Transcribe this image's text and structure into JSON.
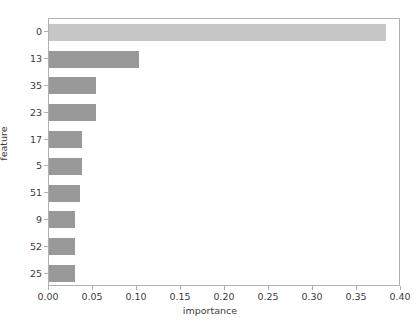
{
  "chart_data": {
    "type": "bar",
    "orientation": "horizontal",
    "title": "",
    "xlabel": "importance",
    "ylabel": "feature",
    "xlim": [
      0.0,
      0.4
    ],
    "ylim_categories_order": "descending-importance",
    "grid": false,
    "legend": null,
    "categories": [
      "0",
      "13",
      "35",
      "23",
      "17",
      "5",
      "51",
      "9",
      "52",
      "25"
    ],
    "values": [
      0.383,
      0.102,
      0.053,
      0.053,
      0.038,
      0.038,
      0.035,
      0.03,
      0.03,
      0.03
    ],
    "xticks": [
      0.0,
      0.05,
      0.1,
      0.15,
      0.2,
      0.25,
      0.3,
      0.35,
      0.4
    ],
    "xtick_labels": [
      "0.00",
      "0.05",
      "0.10",
      "0.15",
      "0.20",
      "0.25",
      "0.30",
      "0.35",
      "0.40"
    ],
    "bar_colors": [
      "#c6c6c6",
      "#999999",
      "#999999",
      "#999999",
      "#999999",
      "#999999",
      "#999999",
      "#999999",
      "#999999",
      "#999999"
    ],
    "axis_color": "#b0b0b0",
    "text_color": "#3c3c3c",
    "background": "#ffffff"
  }
}
